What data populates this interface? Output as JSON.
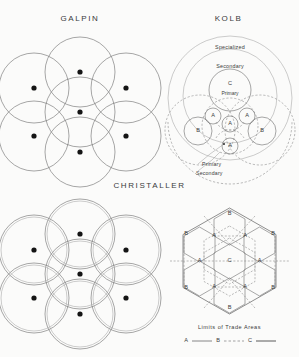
{
  "figure": {
    "background_color": "#fbfbfa",
    "line_color": "#6b6b6b",
    "dot_color": "#141414",
    "width": 299,
    "height": 357
  },
  "panels": {
    "galpin": {
      "title": "GALPIN",
      "center_dot_count": 7,
      "circle_count": 7
    },
    "kolb": {
      "title": "KOLB",
      "ring_outer_label": "Specialized",
      "ring_middle_label": "Secondary",
      "center_letter": "C",
      "center_sub_label": "Primary",
      "a_label": "A",
      "b_label": "B",
      "lead_label_1": "Primary",
      "lead_label_2": "Secondary",
      "a_circle_count": 5,
      "b_circle_count": 2
    },
    "christaller": {
      "title": "CHRISTALLER",
      "circle_count": 7
    },
    "hexagons": {
      "center_letter": "C",
      "a_label": "A",
      "b_label": "B",
      "a_count": 6,
      "b_count": 6,
      "legend_title": "Limits of Trade Areas",
      "legend_a": "A",
      "legend_b": "B",
      "legend_c": "C"
    }
  }
}
